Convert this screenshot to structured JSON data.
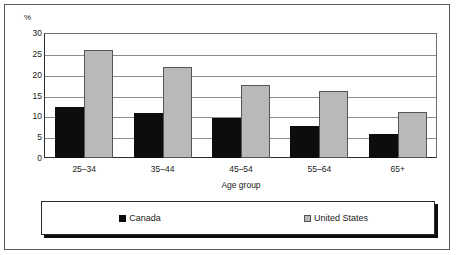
{
  "chart_data": {
    "type": "bar",
    "title": "",
    "subtitle": "",
    "xlabel": "Age group",
    "ylabel": "%",
    "ylim": [
      0,
      30
    ],
    "ytick_step": 5,
    "yticks": [
      "30",
      "25",
      "20",
      "15",
      "10",
      "5",
      "0"
    ],
    "grid": true,
    "legend_position": "bottom",
    "categories": [
      "25–34",
      "35–44",
      "45–54",
      "55–64",
      "65+"
    ],
    "series": [
      {
        "name": "Canada",
        "color": "#0d0d0d",
        "values": [
          12.3,
          10.7,
          9.5,
          7.6,
          5.7
        ]
      },
      {
        "name": "United States",
        "color": "#b9b9b9",
        "values": [
          26.0,
          21.8,
          17.6,
          16.2,
          11.0
        ]
      }
    ]
  },
  "axes": {
    "unit_label": "%",
    "x_axis_title": "Age group"
  },
  "legend": {
    "items": [
      {
        "label": "Canada",
        "swatch": "black-square-swatch"
      },
      {
        "label": "United States",
        "swatch": "gray-square-swatch"
      }
    ]
  }
}
